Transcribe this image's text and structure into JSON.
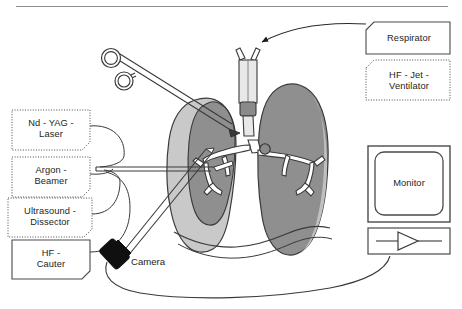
{
  "figure": {
    "top_rule": true,
    "background_color": "#ffffff",
    "line_color": "#3a3a3a",
    "palette": {
      "outer_lung_fill": "#c9c9c9",
      "inner_lung_fill": "#8f8f8f",
      "bronchus_fill": "#ffffff",
      "tube_fill": "#e8e8e8",
      "tube_cuff_fill": "#8a8a8a",
      "camera_head_fill": "#101010",
      "monitor_bezel_fill": "#ffffff",
      "box_border": "#4a4a4a"
    }
  },
  "left_panel": {
    "boxes": [
      {
        "id": "nd-yag-laser",
        "label": "Nd - YAG -\nLaser",
        "border_style": "dotted",
        "x": 12,
        "y": 110,
        "w": 78,
        "h": 40
      },
      {
        "id": "argon-beamer",
        "label": "Argon -\nBeamer",
        "border_style": "dotted",
        "x": 12,
        "y": 157,
        "w": 78,
        "h": 40
      },
      {
        "id": "ultrasound-dissector",
        "label": "Ultrasound -\nDissector",
        "border_style": "dotted",
        "x": 8,
        "y": 198,
        "w": 84,
        "h": 39
      },
      {
        "id": "hf-cauter",
        "label": "HF -\nCauter",
        "border_style": "solid",
        "x": 12,
        "y": 240,
        "w": 78,
        "h": 39
      }
    ]
  },
  "right_panel": {
    "boxes": [
      {
        "id": "respirator",
        "label": "Respirator",
        "border_style": "solid",
        "x": 366,
        "y": 22,
        "w": 84,
        "h": 32
      },
      {
        "id": "hf-jet-ventilator",
        "label": "HF - Jet -\nVentilator",
        "border_style": "dotted",
        "x": 366,
        "y": 60,
        "w": 84,
        "h": 40
      }
    ],
    "monitor": {
      "id": "monitor",
      "label": "Monitor",
      "x": 368,
      "y": 146,
      "w": 82,
      "h": 76
    },
    "amplifier": {
      "id": "video-processor",
      "symbol": "amplifier-triangle",
      "x": 368,
      "y": 228,
      "w": 82,
      "h": 26
    }
  },
  "annotations": {
    "camera": {
      "label": "Camera",
      "x": 131,
      "y": 262
    }
  },
  "anatomy": {
    "right_lung_label": "right lung (ventilated, inflated)",
    "left_lung_label": "left lung (collapsed, operated)",
    "bronchial_tree_label": "bronchial tree",
    "endotracheal_tube_label": "double-lumen endotracheal tube",
    "diaphragm_label": "diaphragm"
  },
  "instruments": {
    "forceps_label": "ring-handled forceps",
    "probe_label": "energy device probe",
    "endoscope_label": "thoracoscope with camera head"
  }
}
